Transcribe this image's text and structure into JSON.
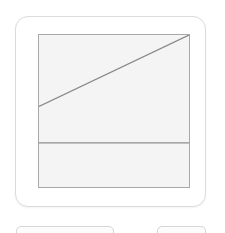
{
  "page": {
    "background_color": "#ffffff",
    "width": 225,
    "height": 233
  },
  "card": {
    "name": "diagram-card",
    "background_color": "#ffffff",
    "border_color": "#dcdcdc",
    "corner_radius": 13
  },
  "figure": {
    "name": "line-diagram",
    "fill_color": "#f4f4f4",
    "border_color": "#a8a8a8",
    "stroke_color": "#888888",
    "bounds": {
      "x": 38,
      "y": 34,
      "width": 152,
      "height": 154
    }
  },
  "chart_data": {
    "type": "line",
    "title": "",
    "xlabel": "",
    "ylabel": "",
    "grid": false,
    "legend": null,
    "xlim": [
      0,
      100
    ],
    "ylim": [
      0,
      100
    ],
    "series": [
      {
        "name": "diagonal",
        "x": [
          0,
          100
        ],
        "y": [
          53,
          100
        ]
      },
      {
        "name": "horizontal-divider",
        "x": [
          0,
          100
        ],
        "y": [
          29,
          29
        ]
      }
    ],
    "annotations": []
  },
  "controls": {
    "primary": {
      "label": ""
    },
    "secondary": {
      "label": ""
    }
  }
}
